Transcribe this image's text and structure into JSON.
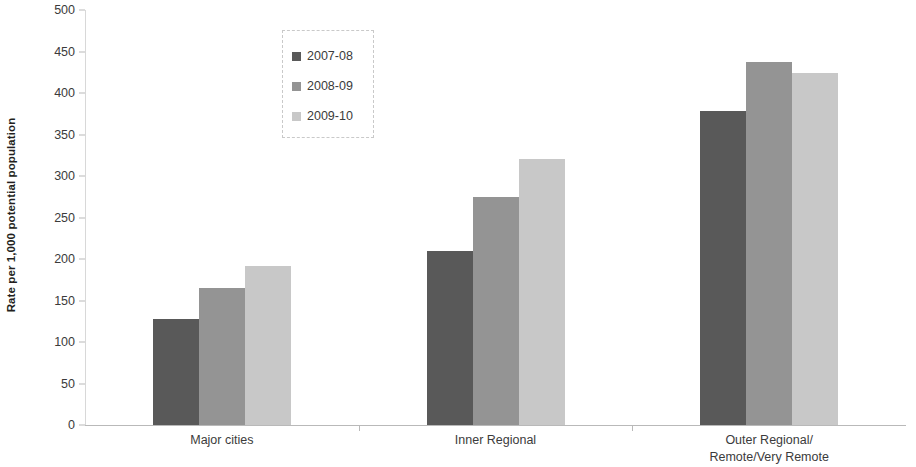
{
  "chart_data": {
    "type": "bar",
    "title": "",
    "subtitle": "",
    "xlabel": "",
    "ylabel": "Rate per 1,000 potential population",
    "ylim": [
      0,
      500
    ],
    "ytick_step": 50,
    "yticks": [
      "500",
      "450",
      "400",
      "350",
      "300",
      "250",
      "200",
      "150",
      "100",
      "50",
      "0"
    ],
    "ytick_values": [
      500,
      450,
      400,
      350,
      300,
      250,
      200,
      150,
      100,
      50,
      0
    ],
    "grid": false,
    "legend_position": "upper-center-left",
    "categories": [
      "Major cities",
      "Inner Regional",
      "Outer Regional/\nRemote/Very Remote"
    ],
    "category_lines": [
      [
        "Major cities"
      ],
      [
        "Inner Regional"
      ],
      [
        "Outer Regional/",
        "Remote/Very Remote"
      ]
    ],
    "series": [
      {
        "name": "2007-08",
        "color": "#595959",
        "values": [
          128,
          210,
          378
        ]
      },
      {
        "name": "2008-09",
        "color": "#949494",
        "values": [
          165,
          275,
          437
        ]
      },
      {
        "name": "2009-10",
        "color": "#c8c8c8",
        "values": [
          191,
          320,
          424
        ]
      }
    ]
  },
  "axis": {
    "line_color": "#b9b9b9",
    "tick_color": "#b9b9b9",
    "text_color": "#3b3b3b"
  },
  "legend": {
    "border_color": "#c9c9c9",
    "entries": [
      {
        "label": "2007-08",
        "color": "#595959"
      },
      {
        "label": "2008-09",
        "color": "#949494"
      },
      {
        "label": "2009-10",
        "color": "#c8c8c8"
      }
    ]
  }
}
